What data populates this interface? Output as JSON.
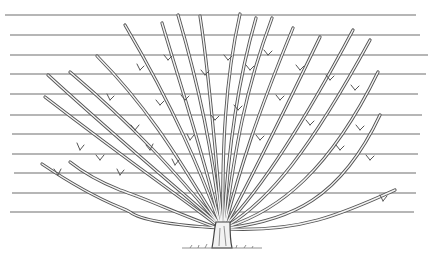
{
  "illustration": {
    "subject": "fan-trained tree on horizontal support wires",
    "caption": "Fan-trained tree against wires",
    "colors": {
      "background": "#ffffff",
      "wire": "#6f6f6f",
      "branch_stroke": "#555555",
      "branch_fill": "#f4f4f4",
      "ground": "#777777"
    },
    "wires_y": [
      15,
      35,
      55,
      74,
      94,
      115,
      134,
      154,
      173,
      193,
      212
    ],
    "wire_count": 11
  }
}
